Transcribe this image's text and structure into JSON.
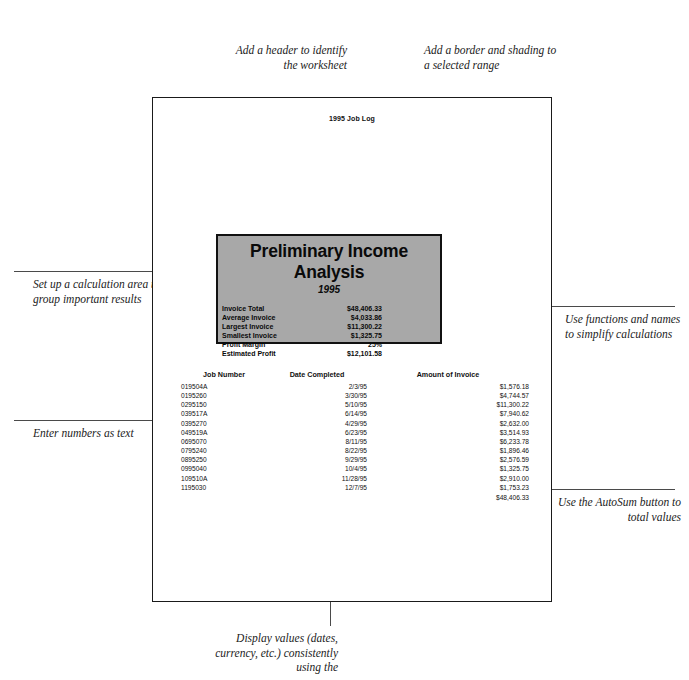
{
  "sheet": {
    "header_text": "1995 Job Log"
  },
  "calc_block": {
    "title": "Preliminary Income Analysis",
    "subtitle": "1995",
    "rows": [
      {
        "label": "Invoice Total",
        "value": "$48,406.33"
      },
      {
        "label": "Average Invoice",
        "value": "$4,033.86"
      },
      {
        "label": "Largest Invoice",
        "value": "$11,300.22"
      },
      {
        "label": "Smallest Invoice",
        "value": "$1,325.75"
      },
      {
        "label": "Profit Margin",
        "value": "25%"
      },
      {
        "label": "Estimated Profit",
        "value": "$12,101.58"
      }
    ],
    "fill_color": "#a8a8a8",
    "border_color": "#111111"
  },
  "job_table": {
    "headers": [
      "Job Number",
      "Date Completed",
      "Amount of Invoice"
    ],
    "rows": [
      {
        "job": "019504A",
        "date": "2/3/95",
        "amount": "$1,576.18"
      },
      {
        "job": "0195260",
        "date": "3/30/95",
        "amount": "$4,744.57"
      },
      {
        "job": "0295150",
        "date": "5/10/95",
        "amount": "$11,300.22"
      },
      {
        "job": "039517A",
        "date": "6/14/95",
        "amount": "$7,940.62"
      },
      {
        "job": "0395270",
        "date": "4/29/95",
        "amount": "$2,632.00"
      },
      {
        "job": "049519A",
        "date": "6/23/95",
        "amount": "$3,514.93"
      },
      {
        "job": "0695070",
        "date": "8/11/95",
        "amount": "$6,233.78"
      },
      {
        "job": "0795240",
        "date": "8/22/95",
        "amount": "$1,896.46"
      },
      {
        "job": "0895250",
        "date": "9/29/95",
        "amount": "$2,576.59"
      },
      {
        "job": "0995040",
        "date": "10/4/95",
        "amount": "$1,325.75"
      },
      {
        "job": "109510A",
        "date": "11/28/95",
        "amount": "$2,910.00"
      },
      {
        "job": "1195030",
        "date": "12/7/95",
        "amount": "$1,753.23"
      }
    ],
    "total": "$48,406.33"
  },
  "callouts": {
    "header": "Add a header to identify the worksheet",
    "border_shading": "Add a border and shading to a selected range",
    "calculation_area": "Set up a calculation area to group important results",
    "numbers_as_text": "Enter numbers as text",
    "functions_names": "Use functions and names to simplify calculations",
    "autosum": "Use the AutoSum button to total values",
    "display_values": "Display values (dates, currency, etc.) consistently using the"
  }
}
